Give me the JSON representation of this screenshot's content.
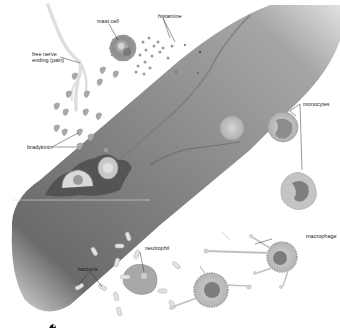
{
  "diagram": {
    "palette": {
      "vessel_dark": "#6e6e6e",
      "vessel_mid": "#8a8a8a",
      "vessel_light": "#b5b5b5",
      "cell_fill": "#bdbdbd",
      "cell_dark": "#7a7a7a",
      "background": "#ffffff",
      "label": "#222222"
    },
    "labels": {
      "mast_cell": "mast cell",
      "histamine": "histamine",
      "free_nerve_ending": "free nerve ending (pain)",
      "bradykinin": "bradykinin",
      "monocytes": "monocytes",
      "macrophage": "macrophage",
      "neutrophil": "neutrophil",
      "bacteria": "bacteria"
    }
  }
}
